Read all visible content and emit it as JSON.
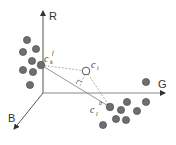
{
  "diagram": {
    "type": "3d-color-space",
    "axes": {
      "r": {
        "label": "R"
      },
      "g": {
        "label": "G"
      },
      "b": {
        "label": "B"
      }
    },
    "colors": {
      "axis": "#555555",
      "dot_fill": "#6e6e6e",
      "dot_stroke": "#444444",
      "dashed_line": "#9a9a9a",
      "solid_line": "#8a8a8a"
    },
    "points": {
      "foreground_center": {
        "base": "c",
        "sub": "k",
        "sup": "f"
      },
      "query": {
        "base": "c",
        "sub": "i"
      },
      "background_center": {
        "base": "c",
        "sub": "l",
        "sup": "b"
      }
    },
    "clusters": {
      "foreground": [
        [
          27,
          40
        ],
        [
          23,
          52
        ],
        [
          36,
          49
        ],
        [
          32,
          61
        ],
        [
          23,
          70
        ],
        [
          33,
          72
        ],
        [
          30,
          85
        ]
      ],
      "background": [
        [
          146,
          82
        ],
        [
          121,
          110
        ],
        [
          137,
          102
        ],
        [
          146,
          102
        ],
        [
          136,
          111
        ],
        [
          116,
          119
        ],
        [
          126,
          119
        ],
        [
          103,
          125
        ]
      ]
    }
  }
}
